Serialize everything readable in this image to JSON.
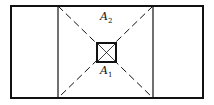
{
  "diagram": {
    "labels": {
      "a2": {
        "main": "A",
        "sub": "2"
      },
      "a1": {
        "main": "A",
        "sub": "1"
      }
    },
    "colors": {
      "stroke": "#111111",
      "background": "#ffffff"
    }
  }
}
